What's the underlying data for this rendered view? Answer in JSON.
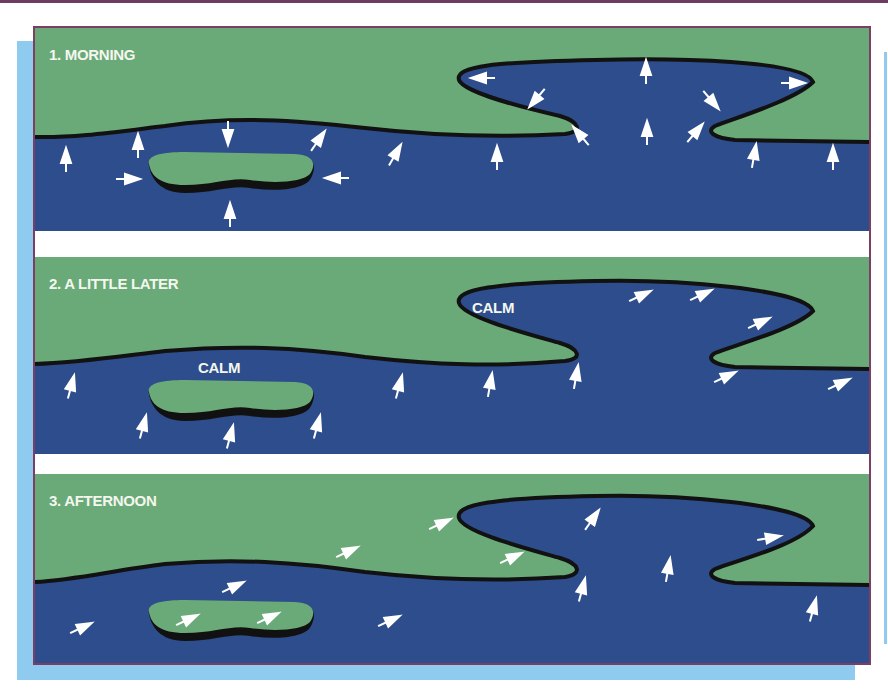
{
  "colors": {
    "land": "#6aa978",
    "water": "#2e4d8c",
    "shoreline": "#121212",
    "arrow": "#ffffff",
    "frame_border": "#7a3f63",
    "shadow": "#8ecbef",
    "label_text": "#f4f7ee"
  },
  "panels": [
    {
      "number": "1.",
      "label": "1.  MORNING",
      "calm_labels": [],
      "arrow_pattern": "white arrows point from water toward land (sea breeze onshore everywhere)"
    },
    {
      "number": "2.",
      "label": "2.  A LITTLE LATER",
      "calm_labels": [
        "CALM",
        "CALM"
      ],
      "arrow_pattern": "calm zones near small island and in inlet; breeze continues elsewhere"
    },
    {
      "number": "3.",
      "label": "3.  AFTERNOON",
      "calm_labels": [],
      "arrow_pattern": "uniform breeze blowing from lower-left toward upper-right across land and water"
    }
  ],
  "calm": {
    "inlet": "CALM",
    "island": "CALM"
  }
}
